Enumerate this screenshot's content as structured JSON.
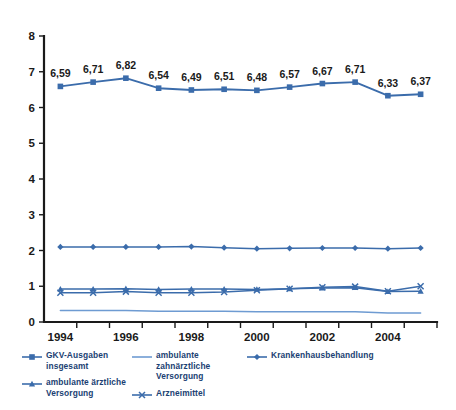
{
  "chart_data": {
    "type": "line",
    "title": "",
    "subtitle": "",
    "xlabel": "",
    "ylabel": "",
    "xlim": [
      1994,
      2005
    ],
    "ylim": [
      0,
      8
    ],
    "y_ticks": [
      "0",
      "1",
      "2",
      "3",
      "4",
      "5",
      "6",
      "7",
      "8"
    ],
    "grid": false,
    "legend_position": "bottom",
    "x": [
      1994,
      1995,
      1996,
      1997,
      1998,
      1999,
      2000,
      2001,
      2002,
      2003,
      2004,
      2005
    ],
    "categories": [
      "1994",
      "1995",
      "1996",
      "1997",
      "1998",
      "1999",
      "2000",
      "2001",
      "2002",
      "2003",
      "2004",
      "2005"
    ],
    "x_tick_labels": [
      "1994",
      "",
      "1996",
      "",
      "1998",
      "",
      "2000",
      "",
      "2002",
      "",
      "2004",
      ""
    ],
    "series": [
      {
        "name": "GKV-Ausgaben insgesamt",
        "marker": "square",
        "color": "#3b6cab",
        "values": [
          6.59,
          6.71,
          6.82,
          6.54,
          6.49,
          6.51,
          6.48,
          6.57,
          6.67,
          6.71,
          6.33,
          6.37
        ],
        "data_labels": [
          "6,59",
          "6,71",
          "6,82",
          "6,54",
          "6,49",
          "6,51",
          "6,48",
          "6,57",
          "6,67",
          "6,71",
          "6,33",
          "6,37"
        ]
      },
      {
        "name": "ambulante ärztliche Versorgung",
        "marker": "triangle",
        "color": "#3b6cab",
        "values": [
          0.92,
          0.92,
          0.93,
          0.91,
          0.92,
          0.92,
          0.91,
          0.93,
          0.95,
          0.96,
          0.85,
          0.86
        ]
      },
      {
        "name": "ambulante zahnärztliche Versorgung",
        "marker": "none",
        "color": "#6e9bd2",
        "values": [
          0.32,
          0.32,
          0.32,
          0.3,
          0.3,
          0.3,
          0.29,
          0.29,
          0.29,
          0.29,
          0.25,
          0.25
        ]
      },
      {
        "name": "Arzneimittel",
        "marker": "cross",
        "color": "#3b6cab",
        "values": [
          0.82,
          0.82,
          0.85,
          0.82,
          0.82,
          0.84,
          0.89,
          0.93,
          0.97,
          0.99,
          0.86,
          1.0
        ]
      },
      {
        "name": "Krankenhausbehandlung",
        "marker": "diamond",
        "color": "#3b6cab",
        "values": [
          2.1,
          2.1,
          2.1,
          2.1,
          2.11,
          2.08,
          2.05,
          2.06,
          2.07,
          2.07,
          2.05,
          2.07
        ]
      }
    ]
  },
  "legend": {
    "columns": [
      [
        {
          "label": "GKV-Ausgaben insgesamt",
          "marker": "square",
          "color": "#3b6cab"
        },
        {
          "label": "ambulante ärztliche Versorgung",
          "marker": "triangle",
          "color": "#3b6cab"
        }
      ],
      [
        {
          "label": "ambulante zahnärztliche Versorgung",
          "marker": "none",
          "color": "#6e9bd2"
        },
        {
          "label": "Arzneimittel",
          "marker": "cross",
          "color": "#3b6cab"
        }
      ],
      [
        {
          "label": "Krankenhausbehandlung",
          "marker": "diamond",
          "color": "#3b6cab"
        }
      ]
    ]
  },
  "colors": {
    "primary": "#3b6cab",
    "secondary": "#6e9bd2",
    "axis": "#1a1a1a",
    "label_text": "#1a1a1a",
    "legend_text": "#1b3f73",
    "background": "#ffffff"
  }
}
